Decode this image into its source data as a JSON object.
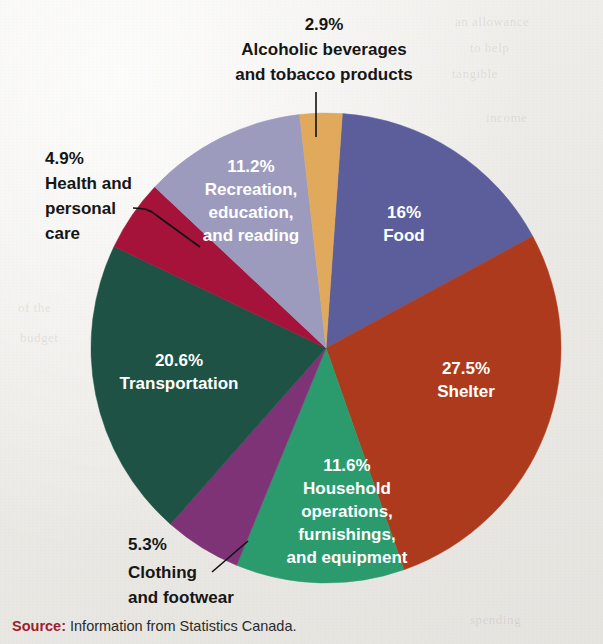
{
  "figure": {
    "background_color": "#efeeeb",
    "source_label": "Source:",
    "source_text": "Information from Statistics Canada."
  },
  "bleed_text": {
    "b1": "an allowance",
    "b2": "to help",
    "b3": "tangible",
    "b4": "of the",
    "b5": "budget",
    "b6": "spending",
    "b7": "income"
  },
  "chart_data": {
    "type": "pie",
    "title": "",
    "subtitle": "",
    "xlabel": "",
    "ylabel": "",
    "units": "percent",
    "total": 100.0,
    "legend_position": "none",
    "labels_on_slices": true,
    "start_angle_deg": -86,
    "direction": "clockwise",
    "center": {
      "x": 326,
      "y": 348
    },
    "radius": 235,
    "categories": [
      "Food",
      "Shelter",
      "Household operations, furnishings, and equipment",
      "Clothing and footwear",
      "Transportation",
      "Health and personal care",
      "Recreation, education, and reading",
      "Alcoholic beverages and tobacco products"
    ],
    "values": [
      16,
      27.5,
      11.6,
      5.3,
      20.6,
      4.9,
      11.2,
      2.9
    ],
    "value_labels": [
      "16%",
      "27.5%",
      "11.6%",
      "5.3%",
      "20.6%",
      "4.9%",
      "11.2%",
      "2.9%"
    ],
    "colors": [
      "#5b5e9b",
      "#ad3a1c",
      "#2b9b6e",
      "#7e3377",
      "#1e5244",
      "#a5123a",
      "#9c9bbe",
      "#e0a95c"
    ],
    "slices": [
      {
        "name": "food",
        "value": 16,
        "value_label": "16%",
        "name_lines": [
          "Food"
        ],
        "color": "#5b5e9b",
        "label_placement": "inside",
        "label_color": "#ffffff"
      },
      {
        "name": "shelter",
        "value": 27.5,
        "value_label": "27.5%",
        "name_lines": [
          "Shelter"
        ],
        "color": "#ad3a1c",
        "label_placement": "inside",
        "label_color": "#ffffff"
      },
      {
        "name": "household-operations",
        "value": 11.6,
        "value_label": "11.6%",
        "name_lines": [
          "Household",
          "operations,",
          "furnishings,",
          "and equipment"
        ],
        "color": "#2b9b6e",
        "label_placement": "inside",
        "label_color": "#ffffff"
      },
      {
        "name": "clothing-and-footwear",
        "value": 5.3,
        "value_label": "5.3%",
        "name_lines": [
          "Clothing",
          "and footwear"
        ],
        "color": "#7e3377",
        "label_placement": "outside-leader",
        "label_color": "#161616"
      },
      {
        "name": "transportation",
        "value": 20.6,
        "value_label": "20.6%",
        "name_lines": [
          "Transportation"
        ],
        "color": "#1e5244",
        "label_placement": "inside",
        "label_color": "#ffffff"
      },
      {
        "name": "health-and-personal-care",
        "value": 4.9,
        "value_label": "4.9%",
        "name_lines": [
          "Health and",
          "personal",
          "care"
        ],
        "color": "#a5123a",
        "label_placement": "outside-leader",
        "label_color": "#161616"
      },
      {
        "name": "recreation-education-reading",
        "value": 11.2,
        "value_label": "11.2%",
        "name_lines": [
          "Recreation,",
          "education,",
          "and reading"
        ],
        "color": "#9c9bbe",
        "label_placement": "inside",
        "label_color": "#ffffff"
      },
      {
        "name": "alcoholic-beverages-and-tobacco",
        "value": 2.9,
        "value_label": "2.9%",
        "name_lines": [
          "Alcoholic beverages",
          "and tobacco products"
        ],
        "color": "#e0a95c",
        "label_placement": "outside-leader",
        "label_color": "#161616"
      }
    ]
  },
  "labels": {
    "alcohol": {
      "value": "2.9%",
      "line1": "Alcoholic beverages",
      "line2": "and tobacco products"
    },
    "health": {
      "value": "4.9%",
      "line1": "Health and",
      "line2": "personal",
      "line3": "care"
    },
    "recreation": {
      "value": "11.2%",
      "line1": "Recreation,",
      "line2": "education,",
      "line3": "and reading"
    },
    "food": {
      "value": "16%",
      "line1": "Food"
    },
    "shelter": {
      "value": "27.5%",
      "line1": "Shelter"
    },
    "household": {
      "value": "11.6%",
      "line1": "Household",
      "line2": "operations,",
      "line3": "furnishings,",
      "line4": "and equipment"
    },
    "transportation": {
      "value": "20.6%",
      "line1": "Transportation"
    },
    "clothing": {
      "value": "5.3%",
      "line1": "Clothing",
      "line2": "and footwear"
    }
  }
}
